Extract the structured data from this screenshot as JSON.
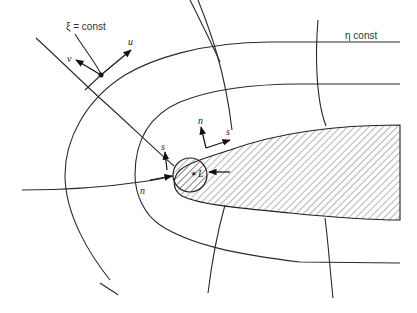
{
  "diagram": {
    "title_labels": {
      "xi_label": "ξ = const",
      "eta_label": "η const"
    },
    "vector_labels": {
      "u": "u",
      "v": "v",
      "n_top": "n",
      "s_top": "s",
      "s_left": "s",
      "n_left": "n",
      "L": "L",
      "L_marker": "✶"
    },
    "body": {
      "fill": "hatched",
      "shape": "blunt elongated body (airfoil-like) with circular leading-edge region"
    },
    "grid": {
      "xi_lines": 4,
      "eta_lines": 5
    },
    "caption_visible": false
  }
}
